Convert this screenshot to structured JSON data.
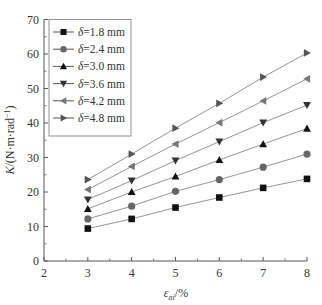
{
  "chart_data": {
    "type": "line",
    "title": "",
    "xlabel": "ε_ai/%",
    "xlabel_main": "ε",
    "xlabel_sub": "ai",
    "xlabel_suffix": "/%",
    "ylabel": "K/(N·m·rad⁻¹)",
    "ylabel_main": "K/(N·m·rad",
    "ylabel_sup": "−1",
    "ylabel_suffix": ")",
    "xlim": [
      2,
      8
    ],
    "ylim": [
      0,
      70
    ],
    "xticks": [
      2,
      3,
      4,
      5,
      6,
      7,
      8
    ],
    "yticks": [
      0,
      10,
      20,
      30,
      40,
      50,
      60,
      70
    ],
    "grid": false,
    "legend_position": "upper left",
    "x": [
      3,
      4,
      5,
      6,
      7,
      8
    ],
    "series": [
      {
        "name": "δ=1.8 mm",
        "marker": "square",
        "color": "#111111",
        "values": [
          9.4,
          12.2,
          15.5,
          18.4,
          21.2,
          23.8
        ]
      },
      {
        "name": "δ=2.4 mm",
        "marker": "circle",
        "color": "#666666",
        "values": [
          12.2,
          15.9,
          20.2,
          23.6,
          27.2,
          31.0
        ]
      },
      {
        "name": "δ=3.0 mm",
        "marker": "triangle-up",
        "color": "#111111",
        "values": [
          15.1,
          20.0,
          24.5,
          29.3,
          33.9,
          38.4
        ]
      },
      {
        "name": "δ=3.6 mm",
        "marker": "triangle-down",
        "color": "#333333",
        "values": [
          17.8,
          23.3,
          29.1,
          34.6,
          40.1,
          45.2
        ]
      },
      {
        "name": "δ=4.2 mm",
        "marker": "triangle-left",
        "color": "#777777",
        "values": [
          20.7,
          27.4,
          33.9,
          40.1,
          46.4,
          52.8
        ]
      },
      {
        "name": "δ=4.8 mm",
        "marker": "triangle-right",
        "color": "#555555",
        "values": [
          23.6,
          31.0,
          38.5,
          45.7,
          53.3,
          60.3
        ]
      }
    ]
  }
}
